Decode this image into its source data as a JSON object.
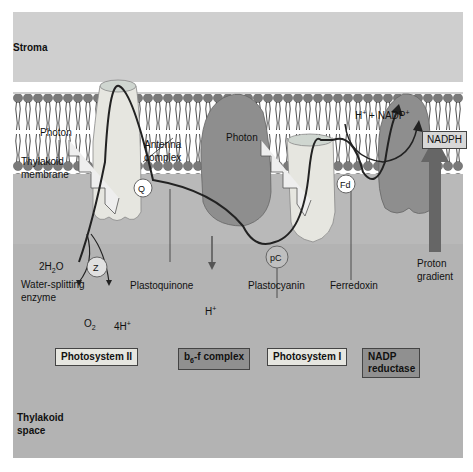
{
  "regions": {
    "stroma": "Stroma",
    "thylakoid_space_line1": "Thylakoid",
    "thylakoid_space_line2": "space"
  },
  "labels": {
    "photon_left": "Photon",
    "photon_right": "Photon",
    "antenna_line1": "Antenna",
    "antenna_line2": "complex",
    "membrane_line1": "Thylakoid",
    "membrane_line2": "membrane",
    "water_reactant": "2H",
    "water_sub": "2",
    "water_o": "O",
    "z": "Z",
    "water_enzyme_line1": "Water-splitting",
    "water_enzyme_line2": "enzyme",
    "o2": "O",
    "o2_sub": "2",
    "four_h": "4H",
    "four_h_sup": "+",
    "q": "Q",
    "plastoquinone": "Plastoquinone",
    "h_plus": "H",
    "h_plus_sup": "+",
    "pc": "pC",
    "plastocyanin": "Plastocyanin",
    "fd": "Fd",
    "ferredoxin": "Ferredoxin",
    "nadp_h": "H",
    "nadp_h_sup": "+",
    "nadp_plus": " + NADP",
    "nadp_plus_sup": "+",
    "nadph": "NADPH",
    "proton_line1": "Proton",
    "proton_line2": "gradient"
  },
  "legend_boxes": {
    "ps2": "Photosystem II",
    "b6f_b": "b",
    "b6f_sub": "6",
    "b6f_rest": "-f complex",
    "ps1": "Photosystem I",
    "nadp_red_line1": "NADP",
    "nadp_red_line2": "reductase"
  },
  "colors": {
    "stroma": "#cfcfcf",
    "lumen": "#b3b3b3",
    "light_protein": "#e6e6e0",
    "dark_protein": "#8e8e8e",
    "lipid_head": "#7a7a7a",
    "arrow": "#222222",
    "proton_arrow": "#666666"
  }
}
